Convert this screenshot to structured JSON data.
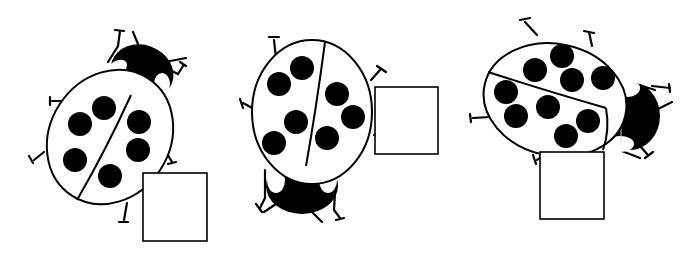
{
  "figure": {
    "colors": {
      "ink": "#000000",
      "paper": "#ffffff"
    },
    "ladybugs": [
      {
        "id": "ladybug-1",
        "spot_count": 6,
        "spots_left_wing": 3,
        "spots_right_wing": 3,
        "head_direction": "up-right",
        "answer_box": {
          "value": ""
        }
      },
      {
        "id": "ladybug-2",
        "spot_count": 7,
        "spots_left_wing": 4,
        "spots_right_wing": 3,
        "head_direction": "down",
        "answer_box": {
          "value": ""
        }
      },
      {
        "id": "ladybug-3",
        "spot_count": 9,
        "spots_left_wing": 4,
        "spots_right_wing": 5,
        "head_direction": "right",
        "answer_box": {
          "value": ""
        }
      }
    ]
  }
}
